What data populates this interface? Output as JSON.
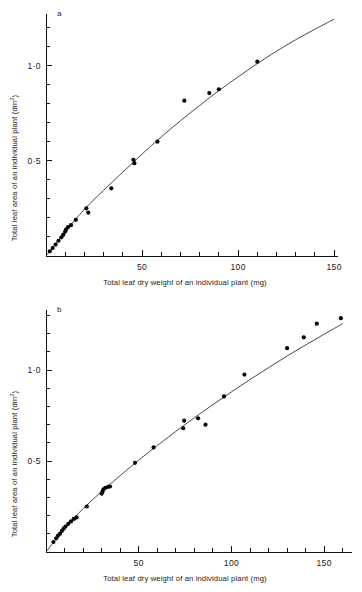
{
  "figure": {
    "background_color": "#ffffff",
    "ink_color": "#111111",
    "point_color": "#000000",
    "curve_color": "#333333"
  },
  "panels": [
    {
      "id": "a",
      "label": "a",
      "xlabel": "Total leaf dry weight of an individual plant (mg)",
      "ylabel_main": "Total leaf area of an individual plant (dm",
      "ylabel_sup": "2",
      "ylabel_tail": ")",
      "x_ticks_major": [
        "50",
        "100",
        "150"
      ],
      "y_ticks_major": [
        "0·5",
        "1·0"
      ]
    },
    {
      "id": "b",
      "label": "b",
      "xlabel": "Total leaf dry weight of an individual plant (mg)",
      "ylabel_main": "Total leaf area of an individual plant (dm",
      "ylabel_sup": "2",
      "ylabel_tail": ")",
      "x_ticks_major": [
        "50",
        "100",
        "150"
      ],
      "y_ticks_major": [
        "0·5",
        "1·0"
      ]
    }
  ],
  "chart_data": [
    {
      "type": "scatter",
      "panel": "a",
      "title": "",
      "xlabel": "Total leaf dry weight of an individual plant (mg)",
      "ylabel": "Total leaf area of an individual plant (dm2)",
      "xlim": [
        0,
        152
      ],
      "ylim": [
        0,
        1.27
      ],
      "x_major_ticks": [
        50,
        100,
        150
      ],
      "x_minor_step": 10,
      "y_major_ticks": [
        0.5,
        1.0
      ],
      "y_minor_step": 0.1,
      "grid": false,
      "legend": "none",
      "series": [
        {
          "name": "observed plants",
          "marker": "filled-circle",
          "points": [
            [
              2.0,
              0.025
            ],
            [
              3.5,
              0.042
            ],
            [
              5.0,
              0.06
            ],
            [
              6.5,
              0.08
            ],
            [
              8.0,
              0.098
            ],
            [
              9.0,
              0.112
            ],
            [
              10.0,
              0.128
            ],
            [
              10.5,
              0.14
            ],
            [
              11.5,
              0.152
            ],
            [
              13.0,
              0.162
            ],
            [
              15.5,
              0.19
            ],
            [
              21.0,
              0.25
            ],
            [
              22.0,
              0.228
            ],
            [
              34.0,
              0.355
            ],
            [
              45.5,
              0.505
            ],
            [
              46.0,
              0.487
            ],
            [
              58.0,
              0.6
            ],
            [
              72.0,
              0.815
            ],
            [
              85.0,
              0.855
            ],
            [
              90.0,
              0.875
            ],
            [
              110.0,
              1.02
            ]
          ]
        },
        {
          "name": "fitted curve",
          "type": "line",
          "description": "smooth concave allometric fit through the origin",
          "points": [
            [
              0,
              0.0
            ],
            [
              10,
              0.128
            ],
            [
              20,
              0.245
            ],
            [
              30,
              0.345
            ],
            [
              40,
              0.44
            ],
            [
              50,
              0.535
            ],
            [
              60,
              0.625
            ],
            [
              70,
              0.71
            ],
            [
              80,
              0.79
            ],
            [
              90,
              0.868
            ],
            [
              100,
              0.94
            ],
            [
              110,
              1.01
            ],
            [
              120,
              1.075
            ],
            [
              130,
              1.135
            ],
            [
              140,
              1.19
            ],
            [
              150,
              1.243
            ]
          ]
        }
      ]
    },
    {
      "type": "scatter",
      "panel": "b",
      "title": "",
      "xlabel": "Total leaf dry weight of an individual plant (mg)",
      "ylabel": "Total leaf area of an individual plant (dm2)",
      "xlim": [
        0,
        165
      ],
      "ylim": [
        0,
        1.33
      ],
      "x_major_ticks": [
        50,
        100,
        150
      ],
      "x_minor_step": 10,
      "y_major_ticks": [
        0.5,
        1.0
      ],
      "y_minor_step": 0.1,
      "grid": false,
      "legend": "none",
      "series": [
        {
          "name": "observed plants",
          "marker": "filled-circle",
          "points": [
            [
              4.0,
              0.055
            ],
            [
              5.5,
              0.075
            ],
            [
              6.5,
              0.09
            ],
            [
              7.5,
              0.1
            ],
            [
              8.5,
              0.115
            ],
            [
              9.5,
              0.128
            ],
            [
              10.5,
              0.14
            ],
            [
              12.0,
              0.155
            ],
            [
              13.5,
              0.168
            ],
            [
              15.0,
              0.182
            ],
            [
              16.5,
              0.19
            ],
            [
              22.0,
              0.25
            ],
            [
              30.0,
              0.32
            ],
            [
              30.5,
              0.332
            ],
            [
              31.0,
              0.345
            ],
            [
              32.0,
              0.352
            ],
            [
              33.5,
              0.358
            ],
            [
              34.5,
              0.36
            ],
            [
              48.0,
              0.49
            ],
            [
              58.0,
              0.575
            ],
            [
              74.0,
              0.68
            ],
            [
              74.5,
              0.722
            ],
            [
              82.0,
              0.735
            ],
            [
              86.0,
              0.7
            ],
            [
              96.0,
              0.855
            ],
            [
              107.0,
              0.975
            ],
            [
              130.0,
              1.12
            ],
            [
              139.0,
              1.18
            ],
            [
              146.0,
              1.255
            ],
            [
              159.0,
              1.285
            ]
          ]
        },
        {
          "name": "fitted curve",
          "type": "line",
          "description": "smooth concave allometric fit through the origin",
          "points": [
            [
              0,
              0.0
            ],
            [
              10,
              0.13
            ],
            [
              20,
              0.238
            ],
            [
              30,
              0.332
            ],
            [
              40,
              0.42
            ],
            [
              50,
              0.505
            ],
            [
              60,
              0.585
            ],
            [
              70,
              0.663
            ],
            [
              80,
              0.738
            ],
            [
              90,
              0.81
            ],
            [
              100,
              0.88
            ],
            [
              110,
              0.948
            ],
            [
              120,
              1.013
            ],
            [
              130,
              1.077
            ],
            [
              140,
              1.138
            ],
            [
              150,
              1.197
            ],
            [
              160,
              1.255
            ]
          ]
        }
      ]
    }
  ]
}
